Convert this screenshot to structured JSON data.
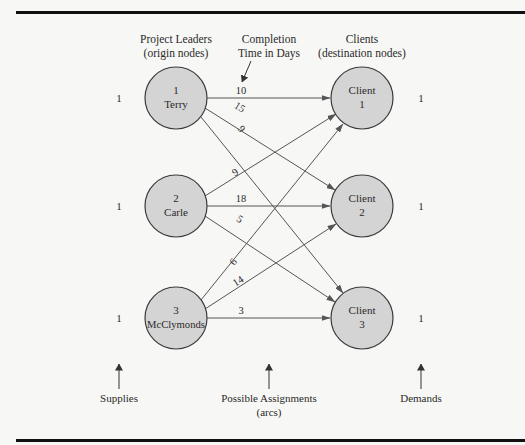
{
  "diagram": {
    "headers": {
      "origins_line1": "Project Leaders",
      "origins_line2": "(origin nodes)",
      "cost_line1": "Completion",
      "cost_line2": "Time in Days",
      "destinations_line1": "Clients",
      "destinations_line2": "(destination nodes)"
    },
    "origins": [
      {
        "id": "1",
        "name": "Terry",
        "supply": "1"
      },
      {
        "id": "2",
        "name": "Carle",
        "supply": "1"
      },
      {
        "id": "3",
        "name": "McClymonds",
        "supply": "1"
      }
    ],
    "destinations": [
      {
        "label": "Client",
        "id": "1",
        "demand": "1"
      },
      {
        "label": "Client",
        "id": "2",
        "demand": "1"
      },
      {
        "label": "Client",
        "id": "3",
        "demand": "1"
      }
    ],
    "arcs": [
      {
        "from": "Terry",
        "to": "Client 1",
        "days": "10"
      },
      {
        "from": "Terry",
        "to": "Client 2",
        "days": "15"
      },
      {
        "from": "Terry",
        "to": "Client 3",
        "days": "9"
      },
      {
        "from": "Carle",
        "to": "Client 1",
        "days": "9"
      },
      {
        "from": "Carle",
        "to": "Client 2",
        "days": "18"
      },
      {
        "from": "Carle",
        "to": "Client 3",
        "days": "5"
      },
      {
        "from": "McClymonds",
        "to": "Client 1",
        "days": "6"
      },
      {
        "from": "McClymonds",
        "to": "Client 2",
        "days": "14"
      },
      {
        "from": "McClymonds",
        "to": "Client 3",
        "days": "3"
      }
    ],
    "footer": {
      "supplies": "Supplies",
      "assignments_line1": "Possible Assignments",
      "assignments_line2": "(arcs)",
      "demands": "Demands"
    },
    "colors": {
      "node_fill": "#d4d4d4",
      "node_stroke": "#3a3a3a",
      "arc_stroke": "#555555",
      "border": "#111111",
      "background": "#f7f7f5"
    }
  }
}
